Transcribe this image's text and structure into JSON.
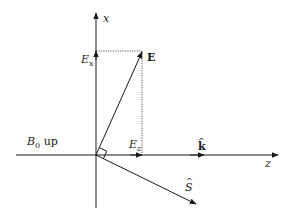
{
  "diagram": {
    "type": "vector-diagram",
    "axes": {
      "vertical_label": "x",
      "horizontal_label": "z"
    },
    "vectors": {
      "E_label": "E",
      "Ex_label": "E",
      "Ex_sub": "x",
      "Ez_label": "E",
      "Ez_sub": "z",
      "k_label": "k",
      "k_hat": "^",
      "S_label": "S",
      "S_hat": "^"
    },
    "field": {
      "B0_label": "B",
      "B0_sub": "0",
      "B0_suffix": " up"
    },
    "colors": {
      "line": "#1a1a1a",
      "dotted": "#555555"
    }
  }
}
